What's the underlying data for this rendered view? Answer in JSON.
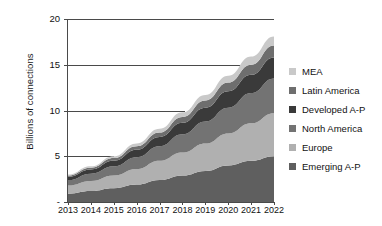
{
  "chart_data": {
    "type": "area",
    "stacked": true,
    "title": "",
    "xlabel": "",
    "ylabel": "Billions of connections",
    "ylim": [
      0,
      20
    ],
    "yticks": [
      "-",
      "5",
      "10",
      "15",
      "20"
    ],
    "ytick_values": [
      0,
      5,
      10,
      15,
      20
    ],
    "grid": true,
    "legend_position": "right",
    "categories": [
      "2013",
      "2014",
      "2015",
      "2016",
      "2017",
      "2018",
      "2019",
      "2020",
      "2021",
      "2022"
    ],
    "x": [
      2013,
      2014,
      2015,
      2016,
      2017,
      2018,
      2019,
      2020,
      2021,
      2022
    ],
    "series": [
      {
        "name": "Emerging A-P",
        "color": "#5f5f5f",
        "values": [
          0.9,
          1.2,
          1.5,
          1.9,
          2.4,
          2.9,
          3.4,
          4.0,
          4.5,
          5.0
        ]
      },
      {
        "name": "Europe",
        "color": "#b0b0b0",
        "values": [
          0.9,
          1.1,
          1.4,
          1.7,
          2.1,
          2.5,
          3.0,
          3.5,
          4.1,
          4.7
        ]
      },
      {
        "name": "North America",
        "color": "#737373",
        "values": [
          0.6,
          0.8,
          1.0,
          1.3,
          1.6,
          2.0,
          2.4,
          2.8,
          3.3,
          3.8
        ]
      },
      {
        "name": "Developed A-P",
        "color": "#3a3a3a",
        "values": [
          0.35,
          0.45,
          0.6,
          0.8,
          1.0,
          1.25,
          1.5,
          1.8,
          2.0,
          2.3
        ]
      },
      {
        "name": "Latin America",
        "color": "#6e6e6e",
        "values": [
          0.15,
          0.2,
          0.3,
          0.4,
          0.5,
          0.65,
          0.8,
          0.95,
          1.1,
          1.3
        ]
      },
      {
        "name": "MEA",
        "color": "#c9c9c9",
        "values": [
          0.1,
          0.15,
          0.2,
          0.3,
          0.4,
          0.5,
          0.6,
          0.75,
          0.9,
          1.0
        ]
      }
    ],
    "totals": [
      3.0,
      3.9,
      5.0,
      6.4,
      8.0,
      9.8,
      11.7,
      13.8,
      15.9,
      18.1
    ],
    "legend": [
      {
        "label": "MEA",
        "color": "#c9c9c9"
      },
      {
        "label": "Latin America",
        "color": "#6e6e6e"
      },
      {
        "label": "Developed A-P",
        "color": "#3a3a3a"
      },
      {
        "label": "North America",
        "color": "#737373"
      },
      {
        "label": "Europe",
        "color": "#b0b0b0"
      },
      {
        "label": "Emerging A-P",
        "color": "#5f5f5f"
      }
    ]
  }
}
